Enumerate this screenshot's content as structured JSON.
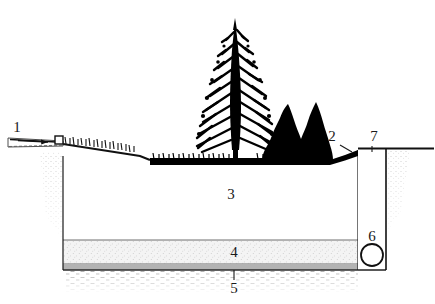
{
  "figure": {
    "type": "cross-section-diagram",
    "background_color": "#ffffff",
    "ink_color": "#000000"
  },
  "callouts": [
    {
      "id": "1",
      "label": "1",
      "refers_to": "inflow-pipe-with-flow-arrow",
      "x": 17,
      "y": 132
    },
    {
      "id": "2",
      "label": "2",
      "refers_to": "vegetated-cover-turf-surface",
      "x": 332,
      "y": 141
    },
    {
      "id": "3",
      "label": "3",
      "refers_to": "main-waste-body-fill",
      "x": 231,
      "y": 199
    },
    {
      "id": "4",
      "label": "4",
      "refers_to": "granular-drainage-layer",
      "x": 234,
      "y": 257
    },
    {
      "id": "5",
      "label": "5",
      "refers_to": "basal-liner-layer",
      "x": 234,
      "y": 290
    },
    {
      "id": "6",
      "label": "6",
      "refers_to": "collection-pipe-section",
      "x": 372,
      "y": 239
    },
    {
      "id": "7",
      "label": "7",
      "refers_to": "vertical-shaft-wall",
      "x": 374,
      "y": 141
    }
  ],
  "layers": {
    "cover_fill": "#000000",
    "body_fill": "#ffffff",
    "drainage_fill": "#f2f2f2",
    "liner_fill": "#b3b3b3",
    "subgrade_texture": "#9a9a9a"
  },
  "geometry": {
    "ground_left_y": 143,
    "ground_base_y": 156,
    "excavation_left_x": 63,
    "excavation_right_x": 358,
    "drainage_top_y": 240,
    "liner_top_y": 264,
    "liner_bottom_y": 270,
    "shaft_left_x": 358,
    "shaft_right_x": 386
  },
  "vegetation": {
    "tree": "conifer-tree-silhouette",
    "shrub": "shrub-cluster-silhouette",
    "grass": "grass-tuft-row"
  },
  "pipe": {
    "inflow": "sloped-inflow-pipe",
    "riser": "small-riser-block",
    "flow_arrow": "flow-direction-arrow",
    "collection": "circular-pipe-cross-section"
  }
}
